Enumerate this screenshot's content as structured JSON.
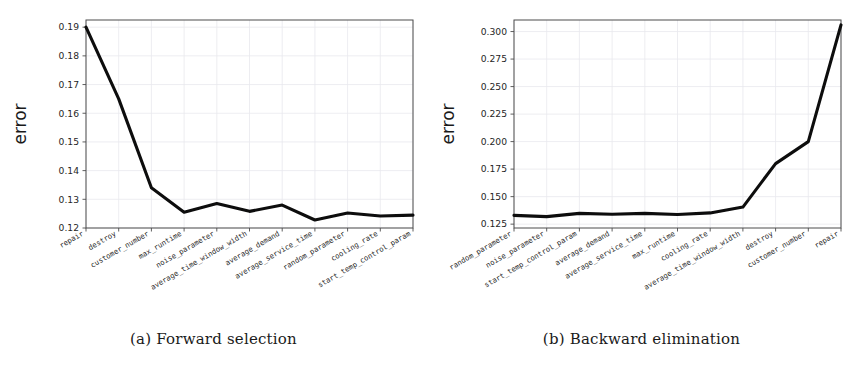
{
  "figure": {
    "panels": [
      {
        "id": "panel-a",
        "caption": "(a) Forward selection",
        "ylabel": "error"
      },
      {
        "id": "panel-b",
        "caption": "(b) Backward elimination",
        "ylabel": "error"
      }
    ]
  },
  "chart_data": [
    {
      "type": "line",
      "title": "(a) Forward selection",
      "xlabel": "",
      "ylabel": "error",
      "grid": true,
      "legend": "none",
      "ylim": [
        0.12,
        0.1925
      ],
      "yticks": [
        0.12,
        0.13,
        0.14,
        0.15,
        0.16,
        0.17,
        0.18,
        0.19
      ],
      "ytick_labels": [
        "0.12",
        "0.13",
        "0.14",
        "0.15",
        "0.16",
        "0.17",
        "0.18",
        "0.19"
      ],
      "categories": [
        "repair",
        "destroy",
        "customer_number",
        "max_runtime",
        "noise_parameter",
        "average_time_window_width",
        "average_demand",
        "average_service_time",
        "random_parameter",
        "cooling_rate",
        "start_temp_control_param"
      ],
      "values": [
        0.19,
        0.165,
        0.134,
        0.1255,
        0.1285,
        0.1258,
        0.128,
        0.1228,
        0.1252,
        0.1242,
        0.1245
      ]
    },
    {
      "type": "line",
      "title": "(b) Backward elimination",
      "xlabel": "",
      "ylabel": "error",
      "grid": true,
      "legend": "none",
      "ylim": [
        0.1215,
        0.3105
      ],
      "yticks": [
        0.125,
        0.15,
        0.175,
        0.2,
        0.225,
        0.25,
        0.275,
        0.3
      ],
      "ytick_labels": [
        "0.125",
        "0.150",
        "0.175",
        "0.200",
        "0.225",
        "0.250",
        "0.275",
        "0.300"
      ],
      "categories": [
        "random_parameter",
        "noise_parameter",
        "start_temp_control_param",
        "average_demand",
        "average_service_time",
        "max_runtime",
        "cooling_rate",
        "average_time_window_width",
        "destroy",
        "customer_number",
        "repair"
      ],
      "values": [
        0.133,
        0.1318,
        0.1348,
        0.134,
        0.1348,
        0.1338,
        0.1352,
        0.1405,
        0.18,
        0.2,
        0.306
      ]
    }
  ]
}
